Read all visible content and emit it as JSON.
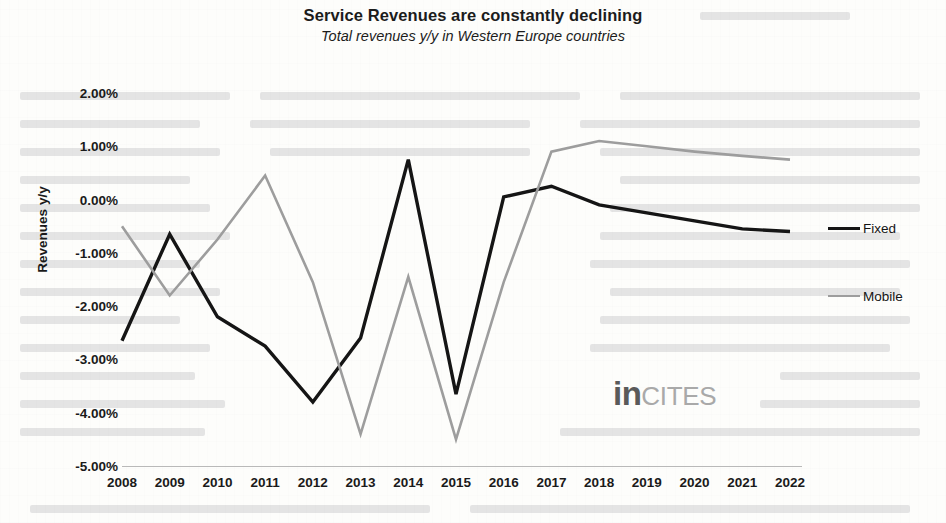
{
  "chart_data": {
    "type": "line",
    "title": "Service Revenues are constantly declining",
    "subtitle": "Total revenues y/y in Western Europe countries",
    "xlabel": "",
    "ylabel": "Revenues y/y",
    "categories": [
      "2008",
      "2009",
      "2010",
      "2011",
      "2012",
      "2013",
      "2014",
      "2015",
      "2016",
      "2017",
      "2018",
      "2019",
      "2020",
      "2021",
      "2022"
    ],
    "ylim": [
      -5.0,
      2.0
    ],
    "ytick_values": [
      2.0,
      1.0,
      0.0,
      -1.0,
      -2.0,
      -3.0,
      -4.0,
      -5.0
    ],
    "ytick_labels": [
      "2.00%",
      "1.00%",
      "0.00%",
      "-1.00%",
      "-2.00%",
      "-3.00%",
      "-4.00%",
      "-5.00%"
    ],
    "grid": false,
    "legend_position": "right",
    "units": "percent",
    "series": [
      {
        "name": "Fixed",
        "color": "#151515",
        "values": [
          -2.65,
          -0.65,
          -2.2,
          -2.75,
          -3.8,
          -2.6,
          0.75,
          -3.65,
          0.05,
          0.25,
          -0.1,
          -0.25,
          -0.4,
          -0.55,
          -0.6
        ]
      },
      {
        "name": "Mobile",
        "color": "#9d9d9d",
        "values": [
          -0.5,
          -1.8,
          -0.75,
          0.45,
          -1.55,
          -4.4,
          -1.45,
          -4.5,
          -1.55,
          0.9,
          1.1,
          1.0,
          0.9,
          0.82,
          0.75
        ]
      }
    ]
  },
  "legend": {
    "entries": [
      {
        "label": "Fixed",
        "color": "#151515"
      },
      {
        "label": "Mobile",
        "color": "#9d9d9d"
      }
    ]
  },
  "watermark": {
    "part_one": "in",
    "part_two": "CITES"
  }
}
